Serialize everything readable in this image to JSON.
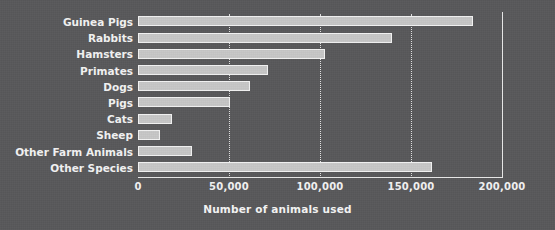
{
  "chart_data": {
    "type": "bar",
    "orientation": "horizontal",
    "title": "",
    "xlabel": "Number of animals used",
    "ylabel": "",
    "xlim": [
      0,
      200000
    ],
    "xticks": [
      "0",
      "50,000",
      "100,000",
      "150,000",
      "200,000"
    ],
    "xtick_values": [
      0,
      50000,
      100000,
      150000,
      200000
    ],
    "grid": "vertical dotted gridlines at 50,000 / 100,000 / 150,000",
    "legend": "none",
    "categories": [
      "Guinea Pigs",
      "Rabbits",
      "Hamsters",
      "Primates",
      "Dogs",
      "Pigs",
      "Cats",
      "Sheep",
      "Other Farm Animals",
      "Other Species"
    ],
    "values": [
      184000,
      139500,
      103000,
      71500,
      61500,
      50500,
      18500,
      12000,
      29500,
      161500
    ],
    "bar_color": "#c6c6c6",
    "bar_edge_color": "#f2f2f2",
    "background_color": "#58585a",
    "text_color": "#f2f2f2",
    "axis_color": "#e7e7e7"
  }
}
